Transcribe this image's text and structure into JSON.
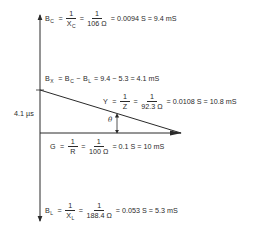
{
  "diagram": {
    "type": "phasor-admittance-diagram",
    "axis_label": "4.1 µs",
    "angle_label": "θ",
    "colors": {
      "line": "#2a2a2a",
      "text": "#2a2a2a",
      "background": "#ffffff"
    },
    "equations": {
      "bc": {
        "symbol": "B",
        "sub": "C",
        "frac1_num": "1",
        "frac1_den_sym": "X",
        "frac1_den_sub": "C",
        "frac2_num": "1",
        "frac2_den": "106 Ω",
        "result": "= 0.0094 S = 9.4 mS"
      },
      "bx": {
        "symbol": "B",
        "sub": "X",
        "term1": "B",
        "term1_sub": "C",
        "term2": "B",
        "term2_sub": "L",
        "result": "= 9.4 − 5.3 = 4.1 mS"
      },
      "y": {
        "symbol": "Y",
        "frac1_num": "1",
        "frac1_den": "Z",
        "frac2_num": "1",
        "frac2_den": "92.3 Ω",
        "result": "= 0.0108 S = 10.8 mS"
      },
      "g": {
        "symbol": "G",
        "frac1_num": "1",
        "frac1_den": "R",
        "frac2_num": "1",
        "frac2_den": "100 Ω",
        "result": "= 0.1 S = 10 mS"
      },
      "bl": {
        "symbol": "B",
        "sub": "L",
        "frac1_num": "1",
        "frac1_den_sym": "X",
        "frac1_den_sub": "L",
        "frac2_num": "1",
        "frac2_den": "188.4 Ω",
        "result": "= 0.053 S = 5.3 mS"
      }
    },
    "symbols": {
      "equals": "=",
      "minus": "−"
    }
  }
}
